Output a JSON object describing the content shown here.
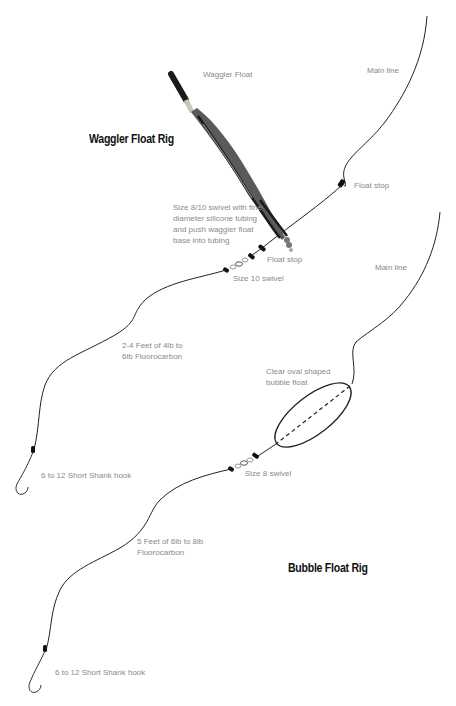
{
  "diagram": {
    "colors": {
      "line": "#222222",
      "label": "#8a8a8a",
      "title": "#111111",
      "float_body": "#5a5a5a",
      "float_dark": "#1a1a1a",
      "float_band": "#c8c8b0"
    },
    "waggler_rig": {
      "title": "Waggler Float Rig",
      "labels": {
        "float": "Waggler Float",
        "main_line": "Main line",
        "float_stop_upper": "Float stop",
        "swivel_tubing_1": "Size 8/10 swivel with fine",
        "swivel_tubing_2": "diameter silicone tubing",
        "swivel_tubing_3": "and push waggler float",
        "swivel_tubing_4": "base into tubing",
        "float_stop_lower": "Float stop",
        "swivel": "Size 10 swivel",
        "leader_1": "2-4 Feet of 4lb to",
        "leader_2": "6lb Fluorocarbon",
        "hook": "6 to 12 Short Shank hook"
      }
    },
    "bubble_rig": {
      "title": "Bubble Float Rig",
      "labels": {
        "main_line": "Main line",
        "float_1": "Clear oval shaped",
        "float_2": "bubble float",
        "swivel": "Size 8 swivel",
        "leader_1": "5 Feet of 6lb to 8lb",
        "leader_2": "Fluorocarbon",
        "hook": "6 to 12 Short Shank hook"
      }
    }
  }
}
